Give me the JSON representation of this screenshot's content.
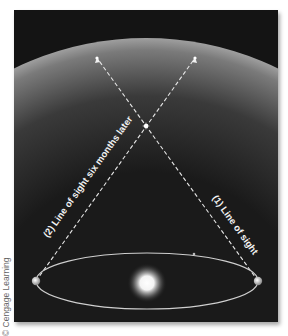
{
  "figure": {
    "labels": {
      "line1": "(1) Line of sight",
      "line2": "(2) Line of sight six months later"
    },
    "credit": "© Cengage Learning",
    "elements": {
      "celestial_sphere": "gray dome representing distant background stars",
      "star": "nearby star at intersection of lines of sight",
      "sun": "central glowing sun",
      "earth_orbit": "elliptical orbit with Earth at two positions six months apart"
    },
    "colors": {
      "background": "#141414",
      "dome_top": "#9a9a9a",
      "line": "#e6e6e6",
      "orbit": "#cfcfcf"
    }
  }
}
